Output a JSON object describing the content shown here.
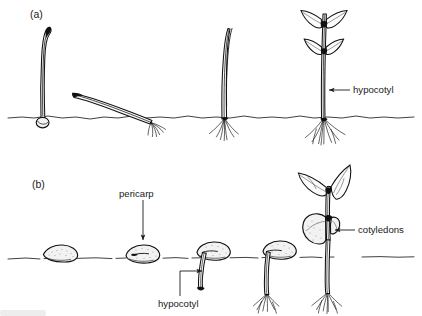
{
  "figure": {
    "type": "scientific-line-drawing",
    "background_color": "#ffffff",
    "ink_color": "#111111",
    "panels": [
      {
        "id": "a",
        "label": "(a)",
        "label_x": 30,
        "label_y": 18,
        "soil_line_y": 117,
        "germination_type": "hypogeal-type sequence (cotyledons remain at/below soil level)",
        "stages": [
          {
            "index": 1,
            "name": "emerging-shoot-with-seed-at-soil-line",
            "x": 40
          },
          {
            "index": 2,
            "name": "prostrate-arched-seedling-with-radicle",
            "x": 120
          },
          {
            "index": 3,
            "name": "erect-seedling-with-root-system",
            "x": 225
          },
          {
            "index": 4,
            "name": "leafy-seedling-with-two-leaf-pairs",
            "x": 325
          }
        ]
      },
      {
        "id": "b",
        "label": "(b)",
        "label_x": 32,
        "label_y": 188,
        "soil_line_y": 257,
        "germination_type": "epigeal-type sequence (cotyledons raised above soil)",
        "stages": [
          {
            "index": 1,
            "name": "ungerminated-seed-on-soil",
            "x": 65
          },
          {
            "index": 2,
            "name": "seed-with-emerging-radicle",
            "x": 145
          },
          {
            "index": 3,
            "name": "seed-with-descending-hypocotyl",
            "x": 215
          },
          {
            "index": 4,
            "name": "seedling-with-elongated-hypocotyl-and-roots",
            "x": 280
          },
          {
            "index": 5,
            "name": "seedling-with-expanded-cotyledons-and-true-leaves",
            "x": 345
          }
        ]
      }
    ],
    "callouts": [
      {
        "id": "hypocotyl-a",
        "text": "hypocotyl",
        "panel": "a",
        "text_x": 352,
        "text_y": 93,
        "arrow": "left",
        "leader": {
          "from_x": 348,
          "from_y": 90,
          "to_x": 325,
          "to_y": 90
        }
      },
      {
        "id": "pericarp-b",
        "text": "pericarp",
        "panel": "b",
        "text_x": 119,
        "text_y": 196,
        "arrow": "down",
        "leader": {
          "from_x": 143,
          "from_y": 200,
          "to_x": 143,
          "to_y": 236
        }
      },
      {
        "id": "cotyledons-b",
        "text": "cotyledons",
        "panel": "b",
        "text_x": 357,
        "text_y": 233,
        "arrow": "left",
        "leader": {
          "from_x": 353,
          "from_y": 230,
          "to_x": 330,
          "to_y": 230
        }
      },
      {
        "id": "hypocotyl-b",
        "text": "hypocotyl",
        "panel": "b",
        "text_x": 158,
        "text_y": 307,
        "arrow": "right",
        "leader": {
          "from_x": 180,
          "from_y": 298,
          "to_x": 180,
          "to_y": 271,
          "elbow_to_x": 207,
          "elbow_to_y": 271
        }
      }
    ]
  }
}
